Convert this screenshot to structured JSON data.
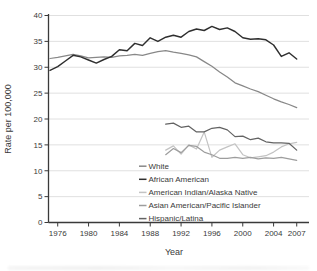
{
  "chart_data": {
    "type": "line",
    "title": "",
    "xlabel": "Year",
    "ylabel": "Rate per 100,000",
    "xlim": [
      1975,
      2007
    ],
    "ylim": [
      0,
      40
    ],
    "yticks": [
      0,
      5,
      10,
      15,
      20,
      25,
      30,
      35,
      40
    ],
    "xticks": [
      1976,
      1980,
      1984,
      1988,
      1992,
      1996,
      2000,
      2004,
      2007
    ],
    "grid": "horizontal-light",
    "legend_position": "inside-bottom-center",
    "axis_color": "#3a3a3a",
    "grid_color": "#dcdcdc",
    "series": [
      {
        "name": "White",
        "slug": "white",
        "color": "#888888",
        "width": 1.25,
        "start_year": 1975,
        "values": [
          31.7,
          31.9,
          32.2,
          32.5,
          32.2,
          31.8,
          31.9,
          32.0,
          31.9,
          32.2,
          32.3,
          32.5,
          32.3,
          32.7,
          33.0,
          33.2,
          32.9,
          32.7,
          32.4,
          32.0,
          31.1,
          30.2,
          29.1,
          28.1,
          27.0,
          26.4,
          25.8,
          25.3,
          24.6,
          23.9,
          23.3,
          22.8,
          22.2
        ]
      },
      {
        "name": "African American",
        "slug": "african-american",
        "color": "#2f2f2f",
        "width": 1.45,
        "start_year": 1975,
        "values": [
          29.4,
          30.1,
          31.2,
          32.3,
          32.0,
          31.4,
          30.8,
          31.5,
          32.1,
          33.4,
          33.2,
          34.6,
          34.2,
          35.7,
          35.0,
          35.8,
          36.2,
          35.8,
          36.9,
          37.4,
          37.1,
          37.9,
          37.3,
          37.6,
          36.9,
          35.7,
          35.4,
          35.5,
          35.3,
          34.3,
          32.1,
          32.8,
          31.6
        ]
      },
      {
        "name": "American Indian/Alaska Native",
        "slug": "american-indian-alaska-native",
        "color": "#c3c3c3",
        "width": 1.2,
        "start_year": 1990,
        "values": [
          14.0,
          14.8,
          13.2,
          15.0,
          14.2,
          17.5,
          12.6,
          14.0,
          14.6,
          15.2,
          13.1,
          12.5,
          12.7,
          12.9,
          13.6,
          14.6,
          15.2,
          15.5
        ]
      },
      {
        "name": "Asian American/Pacific Islander",
        "slug": "asian-american-pacific-islander",
        "color": "#9d9d9d",
        "width": 1.2,
        "start_year": 1990,
        "values": [
          13.1,
          14.3,
          13.5,
          14.9,
          14.7,
          13.6,
          13.1,
          12.4,
          12.4,
          12.6,
          12.4,
          12.6,
          12.3,
          12.5,
          12.4,
          12.6,
          12.3,
          12.0
        ]
      },
      {
        "name": "Hispanic/Latina",
        "slug": "hispanic-latina",
        "color": "#636363",
        "width": 1.25,
        "start_year": 1990,
        "values": [
          19.0,
          19.2,
          18.4,
          18.6,
          17.5,
          17.5,
          18.2,
          18.4,
          17.9,
          16.6,
          16.7,
          16.0,
          16.3,
          15.6,
          15.4,
          15.4,
          15.3,
          14.0
        ]
      }
    ]
  }
}
